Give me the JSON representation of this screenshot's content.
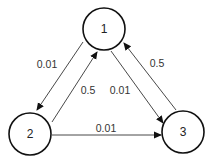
{
  "diagram": {
    "type": "state-transition-graph",
    "colors": {
      "stroke": "#111111",
      "edge": "#333333",
      "text": "#222222",
      "background": "#ffffff"
    },
    "nodes": [
      {
        "id": "1",
        "label": "1",
        "cx": 104,
        "cy": 29,
        "r": 21
      },
      {
        "id": "2",
        "label": "2",
        "cx": 30,
        "cy": 134,
        "r": 21
      },
      {
        "id": "3",
        "label": "3",
        "cx": 183,
        "cy": 132,
        "r": 21
      }
    ],
    "edges": [
      {
        "from": "1",
        "to": "2",
        "label": "0.01",
        "x1": 83,
        "y1": 42,
        "x2": 37,
        "y2": 110,
        "lx": 47,
        "ly": 64
      },
      {
        "from": "2",
        "to": "1",
        "label": "0.5",
        "x1": 52,
        "y1": 122,
        "x2": 97,
        "y2": 52,
        "lx": 88,
        "ly": 90
      },
      {
        "from": "1",
        "to": "3",
        "label": "0.01",
        "x1": 111,
        "y1": 51,
        "x2": 163,
        "y2": 123,
        "lx": 120,
        "ly": 90
      },
      {
        "from": "3",
        "to": "1",
        "label": "0.5",
        "x1": 176,
        "y1": 110,
        "x2": 124,
        "y2": 43,
        "lx": 157,
        "ly": 63
      },
      {
        "from": "2",
        "to": "3",
        "label": "0.01",
        "x1": 52,
        "y1": 135,
        "x2": 161,
        "y2": 135,
        "lx": 106,
        "ly": 128
      }
    ]
  }
}
